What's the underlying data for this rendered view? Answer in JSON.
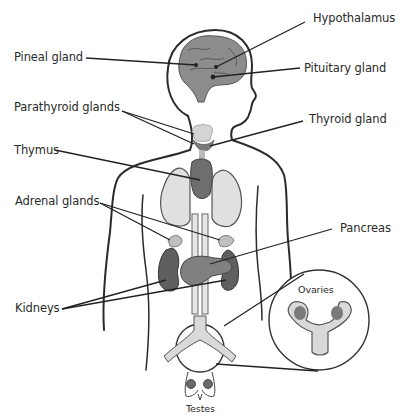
{
  "diagram": {
    "colors": {
      "outline": "#2b2b2b",
      "organ_dark": "#6e6e6e",
      "organ_mid": "#8c8c8c",
      "organ_light": "#d6d6d6",
      "organ_pale": "#e2e2e2",
      "dot": "#222222",
      "background": "#ffffff"
    },
    "labels": {
      "hypothalamus": "Hypothalamus",
      "pineal_gland": "Pineal gland",
      "pituitary_gland": "Pituitary gland",
      "parathyroid_glands": "Parathyroid glands",
      "thyroid_gland": "Thyroid gland",
      "thymus": "Thymus",
      "adrenal_glands": "Adrenal glands",
      "pancreas": "Pancreas",
      "kidneys": "Kidneys",
      "ovaries": "Ovaries",
      "testes": "Testes"
    }
  }
}
